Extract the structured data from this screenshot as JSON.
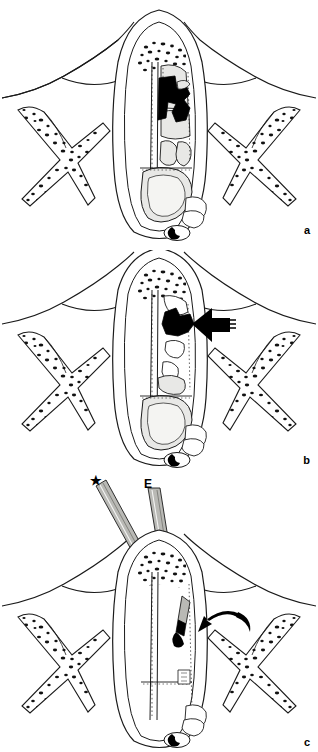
{
  "figure": {
    "background_color": "#ffffff",
    "ink_color": "#000000",
    "soft_tissue_fill": "#e8e8e6",
    "cavity_fill": "#ffffff",
    "instrument_fill": "#b9b9b5",
    "panels": [
      {
        "id": "a",
        "label": "a",
        "caption": "Axial section showing the black lesion occupying the posterior ethmoid region of the right nasal cavity",
        "features": [
          "nasal-septum",
          "cancellous-bone-stipple",
          "ethmoid-air-cells",
          "sphenoid-sinus",
          "lesion-mass",
          "left-turbinate-bone",
          "right-turbinate-bone",
          "optic-canal-marker"
        ]
      },
      {
        "id": "b",
        "label": "b",
        "caption": "The same section with a solid arrow indicating the lesion after partial resection",
        "features": [
          "nasal-septum",
          "cancellous-bone-stipple",
          "ethmoid-air-cells",
          "sphenoid-sinus",
          "residual-lesion",
          "pointer-arrow",
          "left-turbinate-bone",
          "right-turbinate-bone",
          "optic-canal-marker"
        ]
      },
      {
        "id": "c",
        "label": "c",
        "caption": "Endoscopic instrumentation introduced transnasally; curved arrow marks the instrument tip at the lesion site",
        "features": [
          "nasal-septum",
          "cancellous-bone-stipple",
          "sphenoid-sinus",
          "suction-instrument",
          "endoscope",
          "grasping-forceps",
          "curved-pointer-arrow",
          "left-turbinate-bone",
          "right-turbinate-bone",
          "optic-canal-marker"
        ]
      }
    ],
    "annotations": [
      {
        "id": "star",
        "symbol": "★",
        "meaning": "instrument marker",
        "panel": "c"
      },
      {
        "id": "endoscope",
        "symbol": "E",
        "meaning": "endoscope",
        "panel": "c"
      }
    ]
  }
}
